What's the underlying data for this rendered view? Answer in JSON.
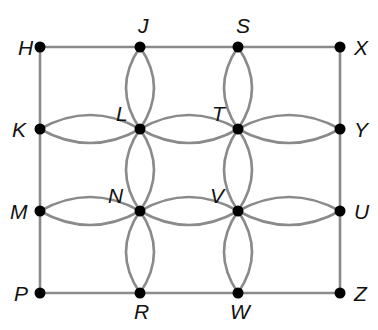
{
  "diagram": {
    "type": "graph",
    "nodes": [
      {
        "id": "H",
        "label": "H"
      },
      {
        "id": "J",
        "label": "J"
      },
      {
        "id": "S",
        "label": "S"
      },
      {
        "id": "X",
        "label": "X"
      },
      {
        "id": "K",
        "label": "K"
      },
      {
        "id": "L",
        "label": "L"
      },
      {
        "id": "T",
        "label": "T"
      },
      {
        "id": "Y",
        "label": "Y"
      },
      {
        "id": "M",
        "label": "M"
      },
      {
        "id": "N",
        "label": "N"
      },
      {
        "id": "V",
        "label": "V"
      },
      {
        "id": "U",
        "label": "U"
      },
      {
        "id": "P",
        "label": "P"
      },
      {
        "id": "R",
        "label": "R"
      },
      {
        "id": "W",
        "label": "W"
      },
      {
        "id": "Z",
        "label": "Z"
      }
    ],
    "single_edges": [
      [
        "H",
        "J"
      ],
      [
        "J",
        "S"
      ],
      [
        "S",
        "X"
      ],
      [
        "X",
        "Y"
      ],
      [
        "Y",
        "U"
      ],
      [
        "U",
        "Z"
      ],
      [
        "P",
        "R"
      ],
      [
        "R",
        "W"
      ],
      [
        "W",
        "Z"
      ],
      [
        "H",
        "K"
      ],
      [
        "K",
        "M"
      ],
      [
        "M",
        "P"
      ]
    ],
    "double_edges": [
      [
        "J",
        "L"
      ],
      [
        "S",
        "T"
      ],
      [
        "L",
        "N"
      ],
      [
        "T",
        "V"
      ],
      [
        "N",
        "R"
      ],
      [
        "V",
        "W"
      ],
      [
        "K",
        "L"
      ],
      [
        "L",
        "T"
      ],
      [
        "T",
        "Y"
      ],
      [
        "M",
        "N"
      ],
      [
        "N",
        "V"
      ],
      [
        "V",
        "U"
      ]
    ],
    "colors": {
      "edge": "#8a8a8a",
      "node": "#000000",
      "label": "#111111"
    }
  }
}
